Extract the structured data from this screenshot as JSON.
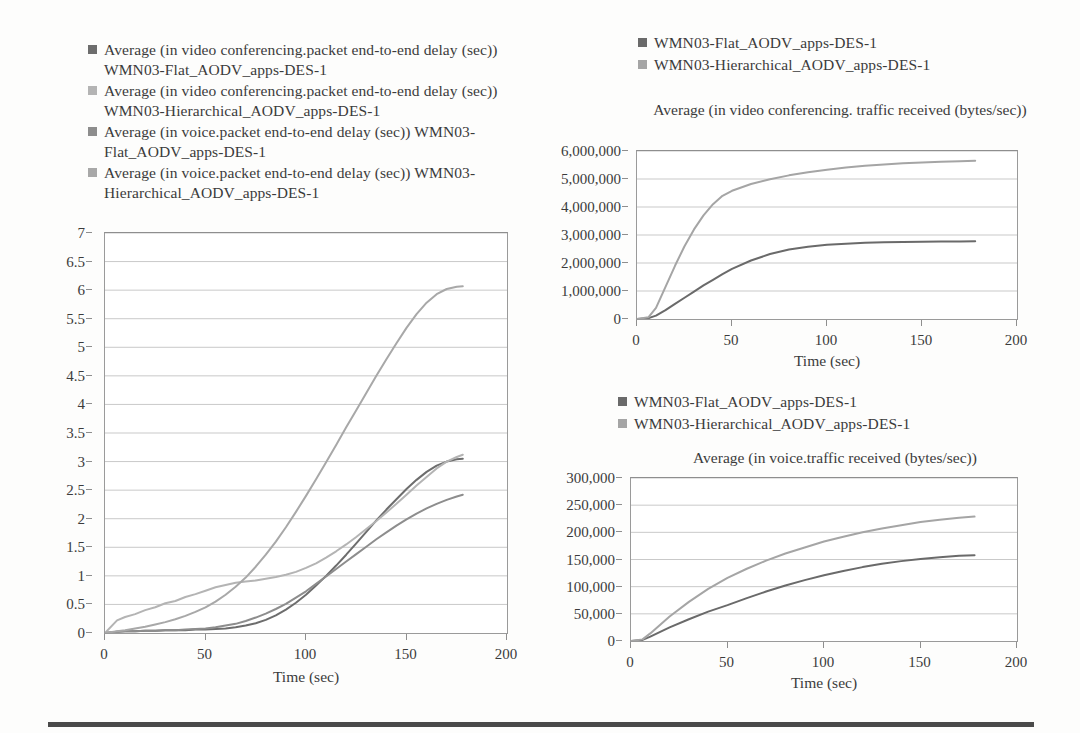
{
  "page": {
    "background": "#fdfdfc",
    "rule_color": "#4a4a4a"
  },
  "colors": {
    "flat_video_delay": "#6d6d6d",
    "hier_video_delay": "#b4b4b4",
    "flat_voice_delay": "#8d8d8d",
    "hier_voice_delay": "#a8a8a8",
    "flat_series": "#6a6a6a",
    "hier_series": "#a5a5a5",
    "grid": "#c9c9c9",
    "axis": "#8e8e8e",
    "text": "#3b3b3b"
  },
  "main_legend": {
    "items": [
      {
        "swatch": "#6d6d6d",
        "label": "Average (in video conferencing.packet end-to-end delay (sec)) WMN03-Flat_AODV_apps-DES-1"
      },
      {
        "swatch": "#b4b4b4",
        "label": "Average (in video conferencing.packet end-to-end delay (sec)) WMN03-Hierarchical_AODV_apps-DES-1"
      },
      {
        "swatch": "#8d8d8d",
        "label": "Average (in voice.packet end-to-end delay (sec)) WMN03-Flat_AODV_apps-DES-1"
      },
      {
        "swatch": "#a8a8a8",
        "label": "Average (in voice.packet end-to-end delay (sec)) WMN03-Hierarchical_AODV_apps-DES-1"
      }
    ]
  },
  "tr_legend": {
    "items": [
      {
        "swatch": "#6a6a6a",
        "label": "WMN03-Flat_AODV_apps-DES-1"
      },
      {
        "swatch": "#a5a5a5",
        "label": "WMN03-Hierarchical_AODV_apps-DES-1"
      }
    ]
  },
  "br_legend": {
    "items": [
      {
        "swatch": "#6a6a6a",
        "label": "WMN03-Flat_AODV_apps-DES-1"
      },
      {
        "swatch": "#a5a5a5",
        "label": "WMN03-Hierarchical_AODV_apps-DES-1"
      }
    ]
  },
  "chart_data": [
    {
      "id": "packet-delay",
      "type": "line",
      "title": "",
      "xlabel": "Time (sec)",
      "ylabel": "",
      "xlim": [
        0,
        200
      ],
      "ylim": [
        0,
        7
      ],
      "xticks": [
        0,
        50,
        100,
        150,
        200
      ],
      "yticks": [
        0,
        0.5,
        1,
        1.5,
        2,
        2.5,
        3,
        3.5,
        4,
        4.5,
        5,
        5.5,
        6,
        6.5,
        7
      ],
      "ytick_labels": [
        "0",
        "0.5",
        "1",
        "1.5",
        "2",
        "2.5",
        "3",
        "3.5",
        "4",
        "4.5",
        "5",
        "5.5",
        "6",
        "6.5",
        "7"
      ],
      "xtick_labels": [
        "0",
        "50",
        "100",
        "150",
        "200"
      ],
      "grid": "horizontal",
      "legend_position": "above-left",
      "x": [
        0,
        6,
        10,
        15,
        20,
        25,
        30,
        35,
        40,
        45,
        50,
        55,
        60,
        65,
        70,
        75,
        80,
        85,
        90,
        95,
        100,
        105,
        110,
        115,
        120,
        125,
        130,
        135,
        140,
        145,
        150,
        155,
        160,
        165,
        170,
        175,
        178
      ],
      "series": [
        {
          "name": "Average (in video conferencing.packet end-to-end delay (sec)) WMN03-Flat_AODV_apps-DES-1",
          "color": "#6d6d6d",
          "values": [
            0,
            0.02,
            0.03,
            0.03,
            0.04,
            0.04,
            0.05,
            0.05,
            0.05,
            0.06,
            0.06,
            0.07,
            0.08,
            0.1,
            0.13,
            0.17,
            0.23,
            0.31,
            0.41,
            0.53,
            0.67,
            0.83,
            1.0,
            1.18,
            1.37,
            1.57,
            1.77,
            1.97,
            2.16,
            2.34,
            2.52,
            2.68,
            2.82,
            2.93,
            3.0,
            3.04,
            3.05
          ]
        },
        {
          "name": "Average (in video conferencing.packet end-to-end delay (sec)) WMN03-Hierarchical_AODV_apps-DES-1",
          "color": "#b4b4b4",
          "values": [
            0,
            0.22,
            0.28,
            0.33,
            0.4,
            0.45,
            0.52,
            0.56,
            0.63,
            0.68,
            0.74,
            0.8,
            0.84,
            0.88,
            0.9,
            0.92,
            0.95,
            0.98,
            1.02,
            1.07,
            1.14,
            1.22,
            1.32,
            1.43,
            1.55,
            1.68,
            1.82,
            1.96,
            2.11,
            2.26,
            2.42,
            2.58,
            2.73,
            2.88,
            3.0,
            3.08,
            3.12
          ]
        },
        {
          "name": "Average (in voice.packet end-to-end delay (sec)) WMN03-Flat_AODV_apps-DES-1",
          "color": "#8d8d8d",
          "values": [
            0,
            0.02,
            0.03,
            0.03,
            0.04,
            0.04,
            0.05,
            0.05,
            0.06,
            0.07,
            0.08,
            0.1,
            0.13,
            0.16,
            0.21,
            0.27,
            0.34,
            0.42,
            0.51,
            0.62,
            0.73,
            0.86,
            0.99,
            1.12,
            1.25,
            1.38,
            1.51,
            1.64,
            1.76,
            1.88,
            1.99,
            2.09,
            2.18,
            2.26,
            2.33,
            2.39,
            2.42
          ]
        },
        {
          "name": "Average (in voice.packet end-to-end delay (sec)) WMN03-Hierarchical_AODV_apps-DES-1",
          "color": "#a8a8a8",
          "values": [
            0,
            0.03,
            0.05,
            0.08,
            0.11,
            0.15,
            0.19,
            0.24,
            0.3,
            0.37,
            0.45,
            0.55,
            0.67,
            0.81,
            0.97,
            1.16,
            1.37,
            1.6,
            1.85,
            2.12,
            2.4,
            2.69,
            2.99,
            3.29,
            3.6,
            3.9,
            4.2,
            4.5,
            4.79,
            5.07,
            5.34,
            5.58,
            5.78,
            5.93,
            6.02,
            6.06,
            6.07
          ]
        }
      ]
    },
    {
      "id": "video-traffic-received",
      "type": "line",
      "title": "Average (in video conferencing. traffic received (bytes/sec))",
      "xlabel": "Time (sec)",
      "ylabel": "",
      "xlim": [
        0,
        200
      ],
      "ylim": [
        0,
        6000000
      ],
      "xticks": [
        0,
        50,
        100,
        150,
        200
      ],
      "yticks": [
        0,
        1000000,
        2000000,
        3000000,
        4000000,
        5000000,
        6000000
      ],
      "ytick_labels": [
        "0",
        "1,000,000",
        "2,000,000",
        "3,000,000",
        "4,000,000",
        "5,000,000",
        "6,000,000"
      ],
      "xtick_labels": [
        "0",
        "50",
        "100",
        "150",
        "200"
      ],
      "grid": "horizontal",
      "legend_position": "above-center",
      "x": [
        0,
        6,
        10,
        15,
        20,
        25,
        30,
        35,
        40,
        45,
        50,
        60,
        70,
        80,
        90,
        100,
        110,
        120,
        130,
        140,
        150,
        160,
        170,
        178
      ],
      "series": [
        {
          "name": "WMN03-Flat_AODV_apps-DES-1",
          "color": "#6a6a6a",
          "values": [
            0,
            30000,
            120000,
            320000,
            540000,
            760000,
            980000,
            1200000,
            1400000,
            1600000,
            1790000,
            2090000,
            2320000,
            2480000,
            2580000,
            2650000,
            2690000,
            2720000,
            2740000,
            2750000,
            2760000,
            2765000,
            2770000,
            2775000
          ]
        },
        {
          "name": "WMN03-Hierarchical_AODV_apps-DES-1",
          "color": "#a5a5a5",
          "values": [
            0,
            60000,
            400000,
            1150000,
            1900000,
            2600000,
            3200000,
            3700000,
            4100000,
            4400000,
            4580000,
            4820000,
            4990000,
            5130000,
            5240000,
            5330000,
            5410000,
            5470000,
            5520000,
            5560000,
            5590000,
            5615000,
            5635000,
            5650000
          ]
        }
      ]
    },
    {
      "id": "voice-traffic-received",
      "type": "line",
      "title": "Average (in voice.traffic received (bytes/sec))",
      "xlabel": "Time (sec)",
      "ylabel": "",
      "xlim": [
        0,
        200
      ],
      "ylim": [
        0,
        300000
      ],
      "xticks": [
        0,
        50,
        100,
        150,
        200
      ],
      "yticks": [
        0,
        50000,
        100000,
        150000,
        200000,
        250000,
        300000
      ],
      "ytick_labels": [
        "0",
        "50,000",
        "100,000",
        "150,000",
        "200,000",
        "250,000",
        "300,000"
      ],
      "xtick_labels": [
        "0",
        "50",
        "100",
        "150",
        "200"
      ],
      "grid": "horizontal",
      "legend_position": "above-center",
      "x": [
        0,
        6,
        10,
        20,
        30,
        40,
        50,
        60,
        70,
        80,
        90,
        100,
        110,
        120,
        130,
        140,
        150,
        160,
        170,
        178
      ],
      "series": [
        {
          "name": "WMN03-Flat_AODV_apps-DES-1",
          "color": "#6a6a6a",
          "values": [
            0,
            2000,
            8000,
            25000,
            40000,
            54000,
            66000,
            79000,
            91000,
            102000,
            112000,
            121000,
            129000,
            136000,
            142000,
            147000,
            151000,
            154000,
            157000,
            158000
          ]
        },
        {
          "name": "WMN03-Hierarchical_AODV_apps-DES-1",
          "color": "#a5a5a5",
          "values": [
            0,
            3000,
            14000,
            45000,
            72000,
            96000,
            116000,
            133000,
            148000,
            161000,
            172000,
            183000,
            192000,
            200000,
            207000,
            213000,
            219000,
            223000,
            227000,
            229000
          ]
        }
      ]
    }
  ]
}
